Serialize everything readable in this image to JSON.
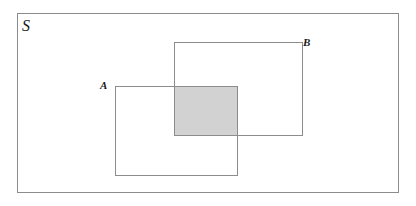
{
  "figure": {
    "type": "venn-diagram-rectangles",
    "background_color": "#ffffff",
    "stroke_color": "#8c8c8c",
    "shade_color": "#d2d2d2",
    "text_color": "#1a1a1a"
  },
  "labels": {
    "universe": "S",
    "set_a": "A",
    "set_b": "B"
  },
  "regions": [
    {
      "name": "universe",
      "label": "S",
      "shaded": false,
      "x": 17,
      "y": 13,
      "width": 382,
      "height": 180
    },
    {
      "name": "set-b",
      "label": "B",
      "shaded": false,
      "x": 174,
      "y": 42,
      "width": 129,
      "height": 94
    },
    {
      "name": "set-a",
      "label": "A",
      "shaded": false,
      "x": 115,
      "y": 86,
      "width": 123,
      "height": 90
    },
    {
      "name": "intersection-a-and-b",
      "label": "",
      "shaded": true,
      "x": 174,
      "y": 86,
      "width": 64,
      "height": 50
    }
  ]
}
